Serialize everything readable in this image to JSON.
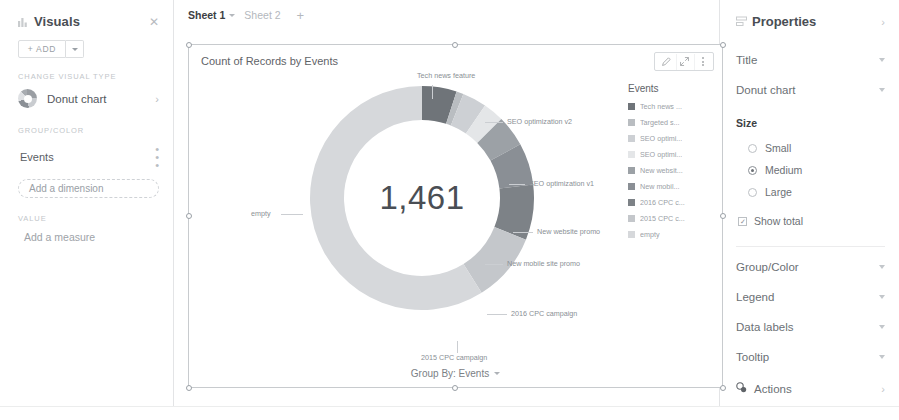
{
  "left_panel": {
    "title": "Visuals",
    "icon": "chart-icon",
    "close_icon": "close-icon",
    "add_button": "+ ADD",
    "change_visual_type_label": "CHANGE VISUAL TYPE",
    "visual_type": "Donut chart",
    "group_color_label": "GROUP/COLOR",
    "group_color_field": "Events",
    "add_dimension": "Add a dimension",
    "value_label": "VALUE",
    "add_measure": "Add a measure"
  },
  "tabs": {
    "items": [
      {
        "label": "Sheet 1",
        "active": true
      },
      {
        "label": "Sheet 2",
        "active": false
      }
    ],
    "add_label": "+"
  },
  "chart": {
    "title": "Count of Records by Events",
    "tools": [
      "pencil-icon",
      "expand-icon",
      "more-vertical-icon"
    ],
    "center_total": "1,461",
    "group_by": "Group By: Events",
    "legend_title": "Events"
  },
  "chart_data": {
    "type": "pie",
    "title": "Count of Records by Events",
    "subtitle": "",
    "center_label": "1,461",
    "total": 1461,
    "legend_title": "Events",
    "legend_position": "right",
    "grid": false,
    "xlabel": "",
    "ylabel": "",
    "categories": [
      "Tech news feature",
      "Targeted s...",
      "SEO optimization v2",
      "SEO optimization v1",
      "New website promo",
      "New mobile site promo",
      "2016 CPC campaign",
      "2015 CPC campaign",
      "empty"
    ],
    "legend_labels": [
      "Tech news ...",
      "Targeted s...",
      "SEO optimi...",
      "SEO optimi...",
      "New websit...",
      "New mobil...",
      "2016 CPC c...",
      "2015 CPC c...",
      "empty"
    ],
    "values": [
      73,
      15,
      51,
      44,
      66,
      88,
      117,
      146,
      861
    ],
    "percentages": [
      5.0,
      1.0,
      3.5,
      3.0,
      4.5,
      6.0,
      8.0,
      10.0,
      59.0
    ],
    "colors": [
      "#6f7479",
      "#b9bdc1",
      "#cdd0d4",
      "#e4e6e8",
      "#9ca1a6",
      "#8a8f95",
      "#7d8287",
      "#c4c7cb",
      "#d6d8db"
    ],
    "slice_labels": [
      {
        "text": "Tech news feature",
        "left": 228,
        "top": 2,
        "line": {
          "x": 243,
          "y": 16,
          "w": 1,
          "vertical": true,
          "h": 14
        }
      },
      {
        "text": "SEO optimization v2",
        "left": 318,
        "top": 48,
        "line": {
          "x": 296,
          "y": 53,
          "w": 18,
          "vertical": false,
          "h": 1
        }
      },
      {
        "text": "SEO optimization v1",
        "left": 340,
        "top": 110,
        "line": {
          "x": 320,
          "y": 115,
          "w": 16,
          "vertical": false,
          "h": 1
        }
      },
      {
        "text": "New website promo",
        "left": 348,
        "top": 158,
        "line": {
          "x": 324,
          "y": 163,
          "w": 20,
          "vertical": false,
          "h": 1
        }
      },
      {
        "text": "New mobile site promo",
        "left": 318,
        "top": 190,
        "line": {
          "x": 296,
          "y": 195,
          "w": 18,
          "vertical": false,
          "h": 1
        }
      },
      {
        "text": "2016 CPC campaign",
        "left": 322,
        "top": 240,
        "line": {
          "x": 298,
          "y": 245,
          "w": 20,
          "vertical": false,
          "h": 1
        }
      },
      {
        "text": "2015 CPC campaign",
        "left": 232,
        "top": 284,
        "line": {
          "x": 268,
          "y": 272,
          "w": 1,
          "vertical": true,
          "h": 12
        }
      },
      {
        "text": "empty",
        "left": 62,
        "top": 140,
        "line": {
          "x": 92,
          "y": 145,
          "w": 22,
          "vertical": false,
          "h": 1
        }
      }
    ]
  },
  "right_panel": {
    "title": "Properties",
    "icon": "properties-icon",
    "expand_icon": "chevron-right-icon",
    "rows": [
      {
        "label": "Title"
      },
      {
        "label": "Donut chart"
      }
    ],
    "size_label": "Size",
    "size_options": [
      {
        "label": "Small",
        "selected": false
      },
      {
        "label": "Medium",
        "selected": true
      },
      {
        "label": "Large",
        "selected": false
      }
    ],
    "show_total": {
      "label": "Show total",
      "checked": true
    },
    "sections": [
      {
        "label": "Group/Color"
      },
      {
        "label": "Legend"
      },
      {
        "label": "Data labels"
      },
      {
        "label": "Tooltip"
      }
    ],
    "actions": {
      "label": "Actions",
      "icon": "actions-icon"
    }
  }
}
